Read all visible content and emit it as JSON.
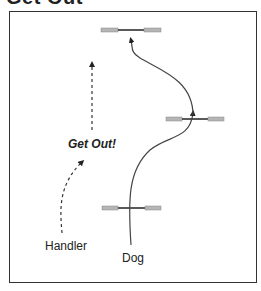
{
  "title": "Get Out",
  "labels": {
    "command": "Get Out!",
    "handler": "Handler",
    "dog": "Dog"
  },
  "colors": {
    "frame": "#333333",
    "jump_bar": "#222222",
    "jump_wing": "#aaaaaa",
    "path": "#444444"
  },
  "diagram": {
    "jumps": [
      {
        "name": "top-jump"
      },
      {
        "name": "right-jump"
      },
      {
        "name": "bottom-jump"
      }
    ],
    "paths": [
      {
        "name": "handler-path",
        "style": "dashed",
        "from": "Handler",
        "to": "up"
      },
      {
        "name": "dog-path",
        "style": "solid",
        "from": "Dog",
        "to": "top-jump"
      }
    ]
  }
}
